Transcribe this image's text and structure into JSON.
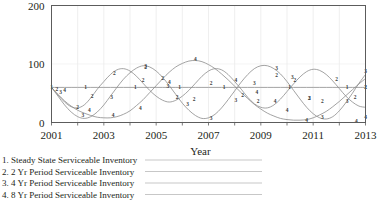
{
  "chart_data": {
    "type": "line",
    "title": "",
    "xlabel": "Year",
    "ylabel": "",
    "xlim": [
      2001,
      2013
    ],
    "ylim": [
      0,
      200
    ],
    "grid": true,
    "legend_position": "below-left",
    "x_ticks": [
      "2001",
      "2003",
      "2005",
      "2007",
      "2009",
      "2011",
      "2013"
    ],
    "x_tick_values": [
      2001,
      2003,
      2005,
      2007,
      2009,
      2011,
      2013
    ],
    "y_ticks": [
      "0",
      "100",
      "200"
    ],
    "y_tick_values": [
      0,
      100,
      200
    ],
    "x": [
      2001,
      2001.25,
      2001.5,
      2001.75,
      2002,
      2002.25,
      2002.5,
      2002.75,
      2003,
      2003.25,
      2003.5,
      2003.75,
      2004,
      2004.25,
      2004.5,
      2004.75,
      2005,
      2005.25,
      2005.5,
      2005.75,
      2006,
      2006.25,
      2006.5,
      2006.75,
      2007,
      2007.25,
      2007.5,
      2007.75,
      2008,
      2008.25,
      2008.5,
      2008.75,
      2009,
      2009.25,
      2009.5,
      2009.75,
      2010,
      2010.25,
      2010.5,
      2010.75,
      2011,
      2011.25,
      2011.5,
      2011.75,
      2012,
      2012.25,
      2012.5,
      2012.75,
      2013
    ],
    "series": [
      {
        "name": "Steady State Serviceable Inventory",
        "marker_label": "1",
        "values": [
          60,
          60,
          60,
          60,
          60,
          60,
          60,
          60,
          60,
          60,
          60,
          60,
          60,
          60,
          60,
          60,
          60,
          60,
          60,
          60,
          60,
          60,
          60,
          60,
          60,
          60,
          60,
          60,
          60,
          60,
          60,
          60,
          60,
          60,
          60,
          60,
          60,
          60,
          60,
          60,
          60,
          60,
          60,
          60,
          60,
          60,
          60,
          60,
          60
        ],
        "label_points": [
          {
            "x": 2001.0,
            "y": 60
          },
          {
            "x": 2002.3,
            "y": 60
          },
          {
            "x": 2004.2,
            "y": 60
          },
          {
            "x": 2005.9,
            "y": 60
          },
          {
            "x": 2007.6,
            "y": 60
          },
          {
            "x": 2010.1,
            "y": 60
          },
          {
            "x": 2012.3,
            "y": 60
          },
          {
            "x": 2013.0,
            "y": 60
          }
        ]
      },
      {
        "name": "2 Yr Period Serviceable Inventory",
        "marker_label": "2",
        "values": [
          60,
          47,
          35,
          27,
          25,
          30,
          42,
          57,
          70,
          82,
          90,
          92,
          88,
          79,
          67,
          55,
          45,
          38,
          35,
          38,
          45,
          55,
          67,
          79,
          88,
          92,
          90,
          82,
          70,
          57,
          43,
          32,
          26,
          25,
          30,
          40,
          53,
          66,
          78,
          87,
          91,
          89,
          82,
          71,
          58,
          45,
          35,
          28,
          26
        ],
        "label_points": [
          {
            "x": 2001.2,
            "y": 58
          },
          {
            "x": 2002.0,
            "y": 27
          },
          {
            "x": 2002.55,
            "y": 45
          },
          {
            "x": 2003.4,
            "y": 84
          },
          {
            "x": 2004.5,
            "y": 72
          },
          {
            "x": 2004.6,
            "y": 95
          },
          {
            "x": 2005.25,
            "y": 76
          },
          {
            "x": 2005.8,
            "y": 44
          },
          {
            "x": 2006.45,
            "y": 41
          },
          {
            "x": 2007.1,
            "y": 68
          },
          {
            "x": 2008.3,
            "y": 47
          },
          {
            "x": 2008.9,
            "y": 36
          },
          {
            "x": 2009.6,
            "y": 82
          },
          {
            "x": 2010.3,
            "y": 72
          },
          {
            "x": 2010.85,
            "y": 42
          },
          {
            "x": 2011.35,
            "y": 37
          },
          {
            "x": 2011.9,
            "y": 75
          },
          {
            "x": 2012.6,
            "y": 43
          },
          {
            "x": 2013.0,
            "y": 60
          }
        ]
      },
      {
        "name": "4 Yr Period Serviceable Inventory",
        "marker_label": "3",
        "values": [
          60,
          45,
          30,
          18,
          10,
          7,
          10,
          18,
          30,
          45,
          60,
          74,
          85,
          93,
          97,
          95,
          88,
          77,
          63,
          48,
          33,
          21,
          12,
          7,
          8,
          14,
          25,
          39,
          54,
          69,
          82,
          92,
          97,
          97,
          92,
          83,
          70,
          55,
          40,
          26,
          15,
          8,
          6,
          10,
          20,
          34,
          50,
          67,
          82
        ],
        "label_points": [
          {
            "x": 2001.35,
            "y": 52
          },
          {
            "x": 2002.2,
            "y": 12
          },
          {
            "x": 2003.3,
            "y": 44
          },
          {
            "x": 2004.6,
            "y": 96
          },
          {
            "x": 2005.45,
            "y": 62
          },
          {
            "x": 2006.2,
            "y": 32
          },
          {
            "x": 2007.1,
            "y": 8
          },
          {
            "x": 2008.05,
            "y": 38
          },
          {
            "x": 2008.75,
            "y": 68
          },
          {
            "x": 2009.6,
            "y": 93
          },
          {
            "x": 2010.2,
            "y": 78
          },
          {
            "x": 2010.85,
            "y": 42
          },
          {
            "x": 2011.35,
            "y": 10
          },
          {
            "x": 2012.3,
            "y": 36
          },
          {
            "x": 2013.0,
            "y": 88
          }
        ]
      },
      {
        "name": "8 Yr Period Serviceable Inventory",
        "marker_label": "4",
        "values": [
          60,
          48,
          37,
          28,
          21,
          16,
          12,
          9,
          8,
          8,
          10,
          14,
          20,
          29,
          39,
          51,
          63,
          75,
          86,
          95,
          101,
          105,
          106,
          104,
          99,
          92,
          83,
          73,
          62,
          51,
          41,
          31,
          23,
          16,
          11,
          7,
          5,
          4,
          4,
          5,
          8,
          13,
          19,
          27,
          36,
          46,
          56,
          66,
          75
        ],
        "label_points": [
          {
            "x": 2001.5,
            "y": 55
          },
          {
            "x": 2002.45,
            "y": 22
          },
          {
            "x": 2003.35,
            "y": 12
          },
          {
            "x": 2004.4,
            "y": 24
          },
          {
            "x": 2005.5,
            "y": 70
          },
          {
            "x": 2006.5,
            "y": 108
          },
          {
            "x": 2008.05,
            "y": 72
          },
          {
            "x": 2008.85,
            "y": 52
          },
          {
            "x": 2009.55,
            "y": 36
          },
          {
            "x": 2010.0,
            "y": 22
          },
          {
            "x": 2010.75,
            "y": 4
          },
          {
            "x": 2012.65,
            "y": 2
          },
          {
            "x": 2013.0,
            "y": 10
          }
        ]
      }
    ]
  },
  "legend": {
    "entries": [
      {
        "index": "1.",
        "label": "Steady State Serviceable Inventory"
      },
      {
        "index": "2.",
        "label": "2 Yr Period Serviceable Inventory"
      },
      {
        "index": "3.",
        "label": "4 Yr Period Serviceable Inventory"
      },
      {
        "index": "4.",
        "label": "8 Yr Period Serviceable Inventory"
      }
    ]
  },
  "colors": {
    "line": "#8b8b8b",
    "axis": "#5c5c5c",
    "grid": "#e4e4e4",
    "text": "#231f20"
  }
}
